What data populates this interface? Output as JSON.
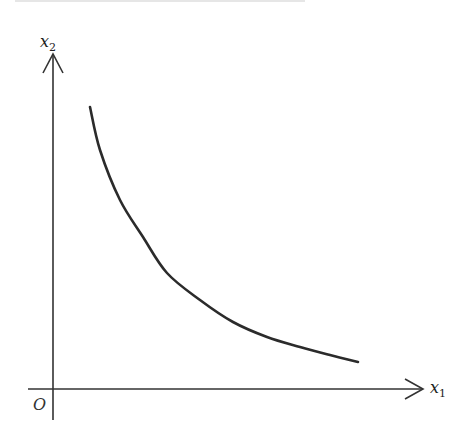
{
  "diagram": {
    "type": "indifference-curve",
    "colors": {
      "axis": "#333333",
      "curve": "#2b2b2b",
      "background": "#ffffff"
    },
    "origin_label": "O",
    "x_axis": {
      "label_main": "x",
      "label_sub": "1"
    },
    "y_axis": {
      "label_main": "x",
      "label_sub": "2"
    },
    "curve": {
      "description": "convex decreasing curve (hyperbola-like)",
      "points_px": [
        [
          90,
          107
        ],
        [
          100,
          150
        ],
        [
          120,
          200
        ],
        [
          143,
          237
        ],
        [
          167,
          273
        ],
        [
          200,
          300
        ],
        [
          233,
          322
        ],
        [
          267,
          337
        ],
        [
          300,
          347
        ],
        [
          330,
          355
        ],
        [
          358,
          362
        ]
      ]
    }
  }
}
